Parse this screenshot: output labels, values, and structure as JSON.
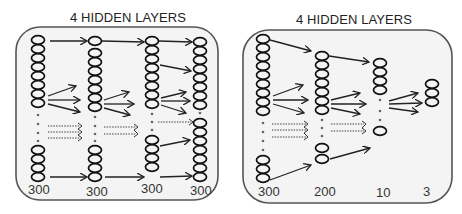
{
  "panels": [
    {
      "title": "4 HIDDEN LAYERS",
      "layer_labels": [
        "300",
        "300",
        "300",
        "300"
      ],
      "layer_sizes": [
        300,
        300,
        300,
        300
      ]
    },
    {
      "title": "4 HIDDEN LAYERS",
      "layer_labels": [
        "300",
        "200",
        "10",
        "3"
      ],
      "layer_sizes": [
        300,
        200,
        10,
        3
      ]
    }
  ],
  "colors": {
    "frame_fill": "#f4f4f4",
    "frame_stroke": "#555555",
    "node_stroke": "#111111",
    "arrow": "#222222",
    "dots": "#666666"
  }
}
